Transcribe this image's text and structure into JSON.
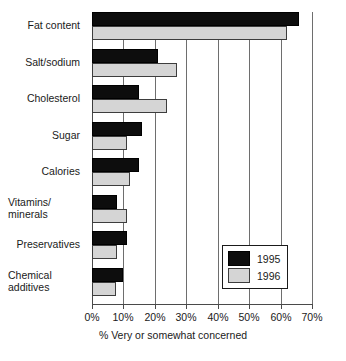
{
  "chart_data": {
    "type": "bar",
    "orientation": "horizontal",
    "title": "",
    "xlabel": "% Very or somewhat concerned",
    "ylabel": "",
    "xlim": [
      0,
      70
    ],
    "xticks": [
      0,
      10,
      20,
      30,
      40,
      50,
      60,
      70
    ],
    "xtick_labels": [
      "0%",
      "10%",
      "20%",
      "30%",
      "40%",
      "50%",
      "60%",
      "70%"
    ],
    "grid": true,
    "legend_position": "inside-right",
    "categories": [
      "Fat content",
      "Salt/sodium",
      "Cholesterol",
      "Sugar",
      "Calories",
      "Vitamins/\nminerals",
      "Preservatives",
      "Chemical\nadditives"
    ],
    "series": [
      {
        "name": "1995",
        "color": "#0d0d0d",
        "values": [
          66,
          21,
          15,
          16,
          15,
          8,
          11,
          10
        ]
      },
      {
        "name": "1996",
        "color": "#d5d5d5",
        "values": [
          62,
          27,
          24,
          11,
          12,
          11,
          8,
          7.5
        ]
      }
    ]
  },
  "legend": {
    "entries": [
      {
        "label": "1995",
        "swatch": "y1995"
      },
      {
        "label": "1996",
        "swatch": "y1996"
      }
    ]
  }
}
